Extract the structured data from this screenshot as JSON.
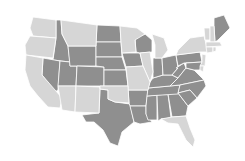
{
  "map": {
    "title": "",
    "type": "choropleth",
    "region": "Contiguous United States",
    "colors": {
      "dark": "#8f8f8f",
      "light": "#d6d6d6",
      "border": "#ffffff",
      "outline": "#6e6e6e",
      "background": "#ffffff"
    },
    "categories": [
      {
        "name": "dark",
        "states": [
          "ID",
          "NV",
          "UT",
          "WY",
          "CO",
          "ND",
          "SD",
          "NE",
          "KS",
          "IA",
          "WI",
          "TX",
          "AR",
          "LA",
          "MS",
          "AL",
          "GA",
          "TN",
          "KY",
          "IN",
          "OH",
          "WV",
          "VA",
          "NC",
          "SC",
          "PA",
          "MD",
          "ME"
        ]
      },
      {
        "name": "light",
        "states": [
          "WA",
          "OR",
          "CA",
          "AZ",
          "NM",
          "MT",
          "MN",
          "MI",
          "IL",
          "MO",
          "OK",
          "FL",
          "NY",
          "VT",
          "NH",
          "MA",
          "CT",
          "RI",
          "NJ",
          "DE"
        ]
      }
    ]
  }
}
